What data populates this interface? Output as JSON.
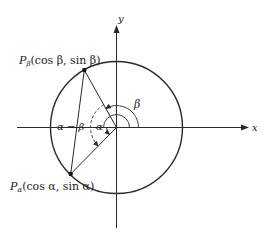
{
  "figure": {
    "axes": {
      "x_label": "x",
      "y_label": "y"
    },
    "points": {
      "p_beta": {
        "name": "P",
        "subscript": "β",
        "coords": "(cos β, sin β)"
      },
      "p_alpha": {
        "name": "P",
        "subscript": "α",
        "coords": "(cos α, sin α)"
      }
    },
    "angles": {
      "beta": "β",
      "alpha": "α",
      "difference": "α − β"
    },
    "colors": {
      "stroke": "#2a2a2a",
      "background": "#ffffff"
    }
  }
}
